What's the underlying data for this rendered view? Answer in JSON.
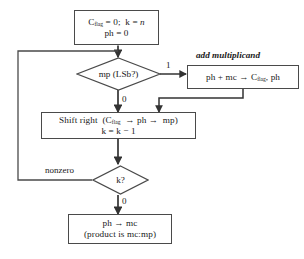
{
  "diagram": {
    "canvas": {
      "width": 304,
      "height": 259,
      "background": "#ffffff"
    },
    "style": {
      "line_color": "#4a4a4a",
      "text_color": "#1a1a1a",
      "arrow_color": "#333333"
    },
    "annotations": [
      {
        "id": "add-multiplicand",
        "text": "add multiplicand",
        "italic": true
      }
    ],
    "nodes": [
      {
        "id": "init",
        "type": "process",
        "lines": [
          {
            "id": "init-line-1",
            "text": "C₅ₗₐ₉ = 0;  k = n"
          },
          {
            "id": "init-line-2",
            "text": "ph = 0"
          }
        ]
      },
      {
        "id": "test-lsb",
        "type": "decision",
        "label": "mp (LSb?)"
      },
      {
        "id": "add",
        "type": "process",
        "lines": [
          {
            "id": "add-line-1",
            "text": "ph + mc → C₅ₗₐ₉, ph"
          }
        ]
      },
      {
        "id": "shift",
        "type": "process",
        "lines": [
          {
            "id": "shift-line-1",
            "text": "Shift right  (C₅ₗₐ₉  → ph →  mp)"
          },
          {
            "id": "shift-line-2",
            "text": "k = k − 1"
          }
        ]
      },
      {
        "id": "test-k",
        "type": "decision",
        "label": "k?"
      },
      {
        "id": "result",
        "type": "process",
        "lines": [
          {
            "id": "result-line-1",
            "text": "ph → mc"
          },
          {
            "id": "result-line-2",
            "text": "(product is mc:mp)"
          }
        ]
      }
    ],
    "edge_labels": [
      {
        "id": "label-lsb-one",
        "text": "1",
        "from": "test-lsb",
        "to": "add"
      },
      {
        "id": "label-lsb-zero",
        "text": "0",
        "from": "test-lsb",
        "to": "shift"
      },
      {
        "id": "label-k-nonzero",
        "text": "nonzero",
        "from": "test-k",
        "to": "test-lsb"
      },
      {
        "id": "label-k-zero",
        "text": "0",
        "from": "test-k",
        "to": "result"
      }
    ]
  }
}
